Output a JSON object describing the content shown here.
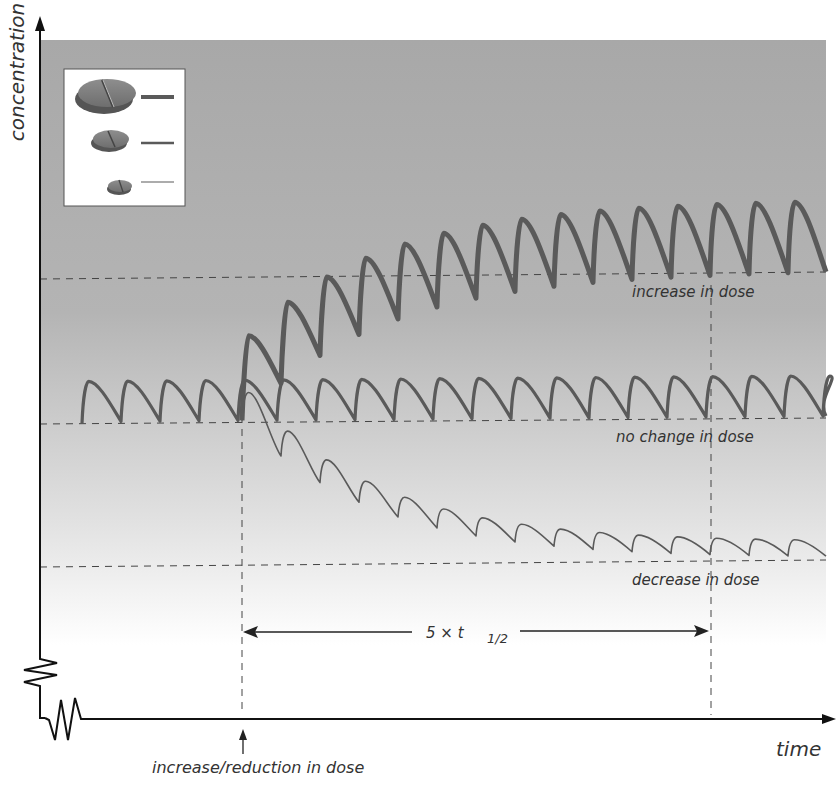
{
  "axes": {
    "y_label": "concentration",
    "x_label": "time"
  },
  "annotations": {
    "event_label": "increase/reduction in dose",
    "half_life_span": "5 × t",
    "half_life_sub": "1/2",
    "curve_labels": {
      "increase": "increase in dose",
      "no_change": "no change in dose",
      "decrease": "decrease in dose"
    }
  },
  "legend": {
    "items": [
      {
        "name": "large-tablet",
        "meaning": "increased dose",
        "line": "thick"
      },
      {
        "name": "medium-tablet",
        "meaning": "unchanged dose",
        "line": "medium"
      },
      {
        "name": "small-tablet",
        "meaning": "reduced dose",
        "line": "thin"
      }
    ]
  },
  "colors": {
    "curve": "#5a5a5a",
    "axis": "#111111",
    "dashed": "#444444",
    "bg_top": "#a6a6a6",
    "bg_bottom": "#ffffff"
  },
  "chart_data": {
    "type": "line",
    "title": "",
    "xlabel": "time",
    "ylabel": "concentration",
    "grid": false,
    "note": "Schematic drug plasma concentration with repeated dosing; steady state reached after ~5 half-lives following dose change",
    "dose_interval_px": 39,
    "change_at_dose": 4,
    "steady_state_levels": {
      "increase_trough": 272,
      "baseline_trough": 418,
      "decrease_trough": 560
    },
    "series": [
      {
        "name": "increase in dose",
        "stroke_width": 5,
        "start_trough": 418,
        "end_trough": 272,
        "amplitude_start": 40,
        "amplitude_end": 70
      },
      {
        "name": "no change in dose",
        "stroke_width": 3.2,
        "start_trough": 418,
        "end_trough": 418,
        "amplitude_start": 40,
        "amplitude_end": 40
      },
      {
        "name": "decrease in dose",
        "stroke_width": 1.6,
        "start_trough": 418,
        "end_trough": 560,
        "amplitude_start": 40,
        "amplitude_end": 20
      }
    ],
    "five_half_lives_px": [
      242,
      710
    ]
  }
}
